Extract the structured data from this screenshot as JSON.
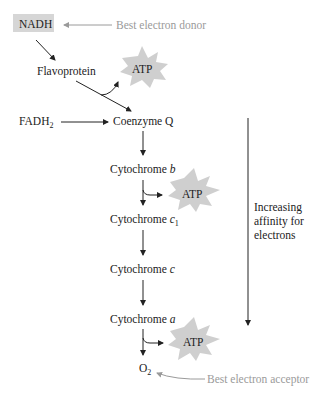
{
  "diagram": {
    "nodes": {
      "nadh": "NADH",
      "flavoprotein": "Flavoprotein",
      "fadh2": "FADH",
      "fadh2_sub": "2",
      "coenzyme_q": "Coenzyme Q",
      "cyt_b_prefix": "Cytochrome ",
      "cyt_b_suffix": "b",
      "cyt_c1_prefix": "Cytochrome ",
      "cyt_c1_suffix": "c",
      "cyt_c1_sub": "1",
      "cyt_c_prefix": "Cytochrome ",
      "cyt_c_suffix": "c",
      "cyt_a_prefix": "Cytochrome ",
      "cyt_a_suffix": "a",
      "o2": "O",
      "o2_sub": "2"
    },
    "atp": [
      "ATP",
      "ATP",
      "ATP"
    ],
    "annotations": {
      "donor": "Best electron donor",
      "acceptor": "Best electron acceptor",
      "affinity_line1": "Increasing",
      "affinity_line2": "affinity for",
      "affinity_line3": "electrons"
    },
    "colors": {
      "node_box": "#d6d6d6",
      "atp_burst": "#cfcfcf",
      "annotation": "#9a9a9a",
      "arrow": "#222222"
    }
  }
}
